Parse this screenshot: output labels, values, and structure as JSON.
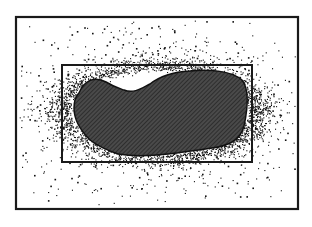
{
  "figure": {
    "width": 312,
    "height": 227,
    "background": "#ffffff",
    "outer_frame": {
      "x": 16,
      "y": 17,
      "w": 282,
      "h": 192,
      "stroke": "#1a1a1a",
      "stroke_width": 2.2
    },
    "inner_box": {
      "x": 62,
      "y": 65,
      "w": 190,
      "h": 97,
      "stroke": "#1a1a1a",
      "stroke_width": 2
    },
    "region": {
      "fill": "#4a4a4a",
      "hatch_color": "#222222",
      "outline": "#111111",
      "path": "M 79 93 C 84 80, 95 76, 106 82 C 114 87, 118 88, 124 90 C 134 94, 142 88, 150 84 C 160 76, 172 72, 190 71 C 210 69, 232 71, 242 80 C 250 90, 247 112, 244 126 C 240 142, 226 146, 212 148 C 198 150, 184 152, 168 154 C 150 156, 130 156, 118 154 C 106 150, 98 146, 90 140 C 82 132, 74 120, 74 108 C 74 100, 76 96, 79 93 Z"
    },
    "points": {
      "color": "#111111",
      "seed": 7,
      "dense_halo_count": 2600,
      "sparse_count": 520
    }
  },
  "chart_data": {
    "type": "scatter",
    "title": "",
    "xlabel": "",
    "ylabel": "",
    "grid": false,
    "legend": null,
    "elements": [
      {
        "kind": "frame",
        "x": 16,
        "y": 17,
        "w": 282,
        "h": 192
      },
      {
        "kind": "bounding_box",
        "x": 62,
        "y": 65,
        "w": 190,
        "h": 97
      },
      {
        "kind": "hatched_region",
        "approx_bbox": {
          "x": 74,
          "y": 70,
          "w": 176,
          "h": 86
        }
      },
      {
        "kind": "point_cloud",
        "distribution": "dense halo around region, sparse scatter toward frame edges"
      }
    ]
  }
}
